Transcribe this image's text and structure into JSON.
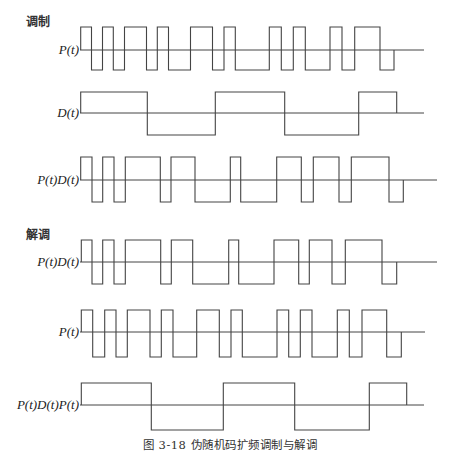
{
  "figure": {
    "caption": "图 3-18   伪随机码扩频调制与解调",
    "sections": [
      {
        "title": "调制",
        "x": 26,
        "y": 12
      },
      {
        "title": "解调",
        "x": 26,
        "y": 225
      }
    ],
    "line_color": "#444444"
  },
  "chart_data": {
    "type": "waveform",
    "title": "图 3-18 伪随机码扩频调制与解调",
    "sections": [
      "调制",
      "解调"
    ],
    "rows": [
      {
        "section": "调制",
        "label": "P(t)",
        "y_high": 27,
        "y_axis": 50,
        "y_low": 70,
        "axis_start": 80,
        "axis_end": 424,
        "transitions": [
          80.7,
          91.5,
          102.5,
          113.3,
          124.5,
          146.5,
          157.3,
          168.5,
          190.5,
          212.5,
          224,
          235.3,
          269.3,
          281.3,
          293.3,
          305.3,
          330,
          342,
          354.7,
          380,
          394
        ],
        "start_level": 1,
        "bits": [
          1,
          -1,
          1,
          -1,
          1,
          -1,
          1,
          -1,
          1,
          -1,
          1,
          -1,
          1,
          -1,
          1,
          -1,
          1,
          -1,
          1,
          -1
        ]
      },
      {
        "section": "调制",
        "label": "D(t)",
        "y_high": 92,
        "y_axis": 113,
        "y_low": 135,
        "axis_start": 80,
        "axis_end": 424,
        "transitions": [
          80.7,
          147.3,
          215.3,
          284.7,
          358.7,
          396.7
        ],
        "start_level": 1,
        "bits": [
          1,
          -1,
          1,
          -1,
          1
        ]
      },
      {
        "section": "调制",
        "label": "P(t)D(t)",
        "y_high": 157,
        "y_axis": 180,
        "y_low": 202,
        "axis_start": 80,
        "axis_end": 437,
        "transitions": [
          80.7,
          92,
          102.7,
          114,
          125.3,
          160.3,
          171,
          195,
          230.3,
          240.7,
          276.7,
          301.3,
          313.3,
          339,
          351.3,
          389,
          403.3
        ],
        "start_level": 1,
        "bits": [
          1,
          -1,
          1,
          -1,
          1,
          -1,
          1,
          -1,
          1,
          -1,
          1,
          -1,
          1,
          -1,
          1,
          -1
        ]
      },
      {
        "section": "解调",
        "label": "P(t)D(t)",
        "y_high": 240,
        "y_axis": 262,
        "y_low": 284,
        "axis_start": 80,
        "axis_end": 437,
        "transitions": [
          81.3,
          92,
          102.7,
          114,
          125.3,
          160.7,
          171.3,
          192.7,
          228.7,
          238.7,
          274,
          298.7,
          309.3,
          332,
          345.3,
          382,
          396.7
        ],
        "start_level": 1,
        "bits": [
          1,
          -1,
          1,
          -1,
          1,
          -1,
          1,
          -1,
          1,
          -1,
          1,
          -1,
          1,
          -1,
          1,
          -1
        ]
      },
      {
        "section": "解调",
        "label": "P(t)",
        "y_high": 310,
        "y_axis": 332,
        "y_low": 357,
        "axis_start": 80,
        "axis_end": 425,
        "transitions": [
          81.3,
          92.7,
          104.7,
          116,
          127.3,
          150,
          161.3,
          173,
          196.7,
          219.3,
          231,
          242.3,
          277,
          288.7,
          300.3,
          312,
          337.3,
          349.3,
          362,
          386.7,
          401.3
        ],
        "start_level": 1,
        "bits": [
          1,
          -1,
          1,
          -1,
          1,
          -1,
          1,
          -1,
          1,
          -1,
          1,
          -1,
          1,
          -1,
          1,
          -1,
          1,
          -1,
          1,
          -1
        ]
      },
      {
        "section": "解调",
        "label": "P(t)D(t)P(t)",
        "y_high": 383,
        "y_axis": 405,
        "y_low": 430,
        "axis_start": 80,
        "axis_end": 424,
        "transitions": [
          81.3,
          151.3,
          223.3,
          294.7,
          369.3,
          406.7
        ],
        "start_level": 1,
        "bits": [
          1,
          -1,
          1,
          -1,
          1
        ]
      }
    ]
  }
}
